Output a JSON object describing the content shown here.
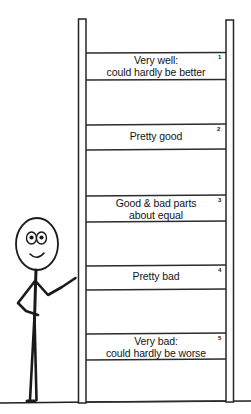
{
  "figure": {
    "kind": "hand-drawn-diagram",
    "colors": {
      "ink": "#1a1a1a",
      "background": "#ffffff",
      "line": "#2b2b2b"
    }
  },
  "ladder": {
    "rail_left_label": "ladder-rail-left",
    "rail_right_label": "ladder-rail-right",
    "ground_label": "ground-line",
    "rungs": [
      {
        "number": "1",
        "line1": "Very well:",
        "line2": "could hardly be better",
        "top": 53,
        "bottom": 80
      },
      {
        "number": "2",
        "line1": "Pretty good",
        "line2": "",
        "top": 125,
        "bottom": 150
      },
      {
        "number": "3",
        "line1": "Good & bad parts",
        "line2": "about equal",
        "top": 196,
        "bottom": 222
      },
      {
        "number": "4",
        "line1": "Pretty bad",
        "line2": "",
        "top": 266,
        "bottom": 290
      },
      {
        "number": "5",
        "line1": "Very bad:",
        "line2": "could hardly be worse",
        "top": 334,
        "bottom": 360
      }
    ],
    "extra_rung_lines": [
      402
    ]
  },
  "person": {
    "label": "stick-figure-person",
    "head": "oval-head",
    "eyes": "two-eyes",
    "mouth": "smile",
    "arm": "arm-reaching-to-ladder",
    "legs": "two-legs"
  }
}
